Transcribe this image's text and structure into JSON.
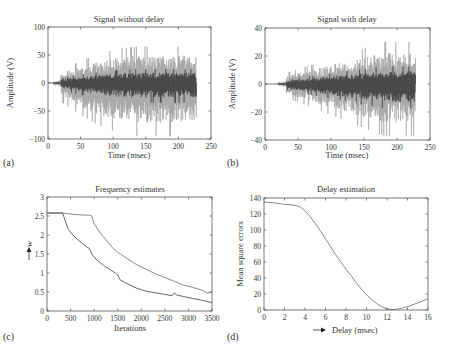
{
  "panels": [
    {
      "id": "a",
      "panel_label": "(a)"
    },
    {
      "id": "b",
      "panel_label": "(b)"
    },
    {
      "id": "c",
      "panel_label": "(c)"
    },
    {
      "id": "d",
      "panel_label": "(d)"
    }
  ],
  "chart_data": [
    {
      "id": "a",
      "type": "line",
      "title": "Signal without delay",
      "xlabel": "Time (msec)",
      "ylabel": "Amplitude (V)",
      "xlim": [
        0,
        250
      ],
      "ylim": [
        -100,
        100
      ],
      "xticks": [
        0,
        50,
        100,
        150,
        200,
        250
      ],
      "yticks": [
        -100,
        -50,
        0,
        50,
        100
      ],
      "grid": false,
      "signal_end": 228,
      "signal_start": 8,
      "series": [
        {
          "name": "signal component 1 (light)",
          "color": "#9a9a9a",
          "envelope_peak": 65,
          "envelope_min_peak": -95
        },
        {
          "name": "signal component 2 (dark)",
          "color": "#2a2a2a",
          "envelope_peak": 35,
          "envelope_min_peak": -50
        }
      ],
      "annotations": [
        "Signal oscillates near 0 until ~20 msec, max ≈ 65 V, min ≈ -97 V around 110 msec"
      ]
    },
    {
      "id": "b",
      "type": "line",
      "title": "Signal with delay",
      "xlabel": "Time (msec)",
      "ylabel": "Amplitude (V)",
      "xlim": [
        0,
        250
      ],
      "ylim": [
        -40,
        40
      ],
      "xticks": [
        0,
        50,
        100,
        150,
        200,
        250
      ],
      "yticks": [
        -40,
        -20,
        0,
        20,
        40
      ],
      "grid": false,
      "signal_end": 228,
      "signal_start": 20,
      "series": [
        {
          "name": "signal component 1 (light)",
          "color": "#9a9a9a",
          "envelope_peak": 30,
          "envelope_min_peak": -37
        },
        {
          "name": "signal component 2 (dark)",
          "color": "#2a2a2a",
          "envelope_peak": 18,
          "envelope_min_peak": -25
        }
      ],
      "annotations": [
        "Max ≈ 30 V near 200 msec, min ≈ -37 V near 160 msec"
      ]
    },
    {
      "id": "c",
      "type": "line",
      "title": "Frequency estimates",
      "xlabel": "Iterations",
      "ylabel": "w",
      "ylabel_arrow": "up",
      "xlim": [
        0,
        3500
      ],
      "ylim": [
        0,
        3
      ],
      "xticks": [
        0,
        500,
        1000,
        1500,
        2000,
        2500,
        3000,
        3500
      ],
      "yticks": [
        0,
        0.5,
        1,
        1.5,
        2,
        2.5,
        3
      ],
      "ytick_labels": [
        "0",
        "0.5",
        "1",
        "1.5",
        "2",
        "2.5",
        "3"
      ],
      "grid": false,
      "series": [
        {
          "name": "estimate 1 (upper)",
          "color": "#7a7a7a",
          "x": [
            0,
            350,
            500,
            700,
            900,
            950,
            1000,
            1100,
            1200,
            1300,
            1400,
            1500,
            1700,
            1900,
            2100,
            2300,
            2500,
            2700,
            2900,
            3100,
            3300,
            3400,
            3500
          ],
          "y": [
            2.58,
            2.58,
            2.55,
            2.53,
            2.52,
            2.5,
            2.3,
            2.1,
            1.95,
            1.8,
            1.65,
            1.55,
            1.38,
            1.22,
            1.1,
            0.98,
            0.88,
            0.78,
            0.68,
            0.62,
            0.54,
            0.47,
            0.5
          ]
        },
        {
          "name": "estimate 2 (lower)",
          "color": "#555555",
          "x": [
            0,
            330,
            380,
            450,
            550,
            650,
            750,
            850,
            900,
            950,
            1050,
            1200,
            1350,
            1450,
            1500,
            1550,
            1700,
            1900,
            2100,
            2300,
            2500,
            2650,
            2700,
            2750,
            2900,
            3100,
            3300,
            3500
          ],
          "y": [
            2.58,
            2.58,
            2.4,
            2.15,
            2.0,
            1.88,
            1.78,
            1.68,
            1.65,
            1.5,
            1.35,
            1.2,
            1.08,
            1.0,
            0.95,
            0.82,
            0.72,
            0.6,
            0.52,
            0.48,
            0.44,
            0.4,
            0.48,
            0.42,
            0.38,
            0.33,
            0.28,
            0.22
          ]
        }
      ]
    },
    {
      "id": "d",
      "type": "line",
      "title": "Delay estimation",
      "xlabel": "Delay (msec)",
      "xlabel_arrow": "right",
      "ylabel": "Mean square errors",
      "xlim": [
        0,
        16
      ],
      "ylim": [
        0,
        140
      ],
      "xticks": [
        0,
        2,
        4,
        6,
        8,
        10,
        12,
        14,
        16
      ],
      "yticks": [
        0,
        20,
        40,
        60,
        80,
        100,
        120,
        140
      ],
      "grid": false,
      "series": [
        {
          "name": "MSE",
          "color": "#7a7a7a",
          "x": [
            0,
            1,
            2,
            3,
            3.5,
            4,
            4.5,
            5,
            5.5,
            6,
            6.5,
            7,
            7.5,
            8,
            8.5,
            9,
            9.5,
            10,
            10.5,
            11,
            11.5,
            12,
            12.5,
            13,
            13.5,
            14,
            15,
            16
          ],
          "y": [
            135,
            134,
            132,
            131,
            129,
            124,
            117,
            108,
            99,
            89,
            79,
            69,
            60,
            51,
            43,
            34,
            26,
            19,
            13,
            8,
            4,
            1.5,
            0.5,
            1,
            2.5,
            4,
            9,
            14
          ]
        }
      ]
    }
  ]
}
